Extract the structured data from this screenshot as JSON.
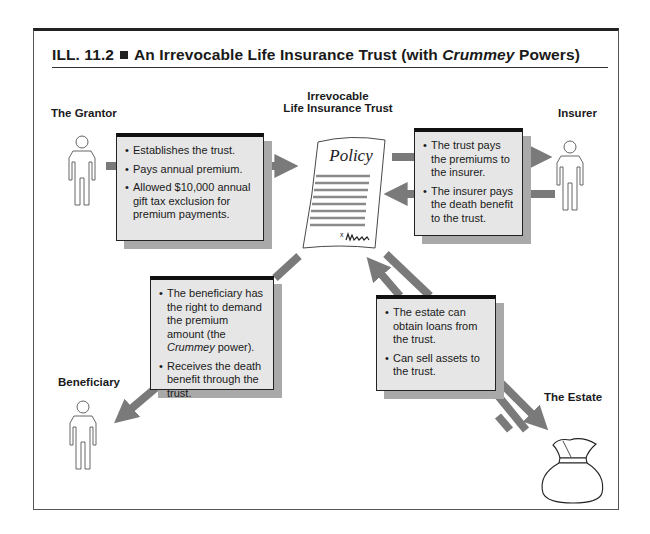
{
  "title": {
    "prefix": "ILL. 11.2",
    "text_before": "An Irrevocable Life Insurance Trust (with ",
    "italic": "Crummey",
    "text_after": " Powers)"
  },
  "nodes": {
    "grantor": {
      "label": "The Grantor",
      "icon": "person-icon"
    },
    "trust": {
      "label_line1": "Irrevocable",
      "label_line2": "Life Insurance Trust",
      "icon": "policy-document-icon",
      "policy_heading": "Policy",
      "signature_mark": "x"
    },
    "insurer": {
      "label": "Insurer",
      "icon": "person-icon"
    },
    "beneficiary": {
      "label": "Beneficiary",
      "icon": "person-icon"
    },
    "estate": {
      "label": "The Estate",
      "icon": "money-bag-icon"
    }
  },
  "boxes": {
    "grantor": {
      "bullets": [
        "Establishes the trust.",
        "Pays annual premium.",
        "Allowed $10,000 annual gift tax exclusion for premium payments."
      ]
    },
    "insurer": {
      "bullets": [
        "The trust pays the premiums to the insurer.",
        "The insurer pays the death benefit to the trust."
      ]
    },
    "beneficiary": {
      "bullet1": "The beneficiary has the right to demand the premium amount",
      "bullet1_pre": "(the ",
      "bullet1_italic": "Crummey",
      "bullet1_post": " power).",
      "bullet2": "Receives the death benefit through the trust."
    },
    "estate": {
      "bullets": [
        "The estate can obtain loans from the trust.",
        "Can sell assets to the trust."
      ]
    }
  },
  "colors": {
    "arrow": "#7a7a7a",
    "box_fill": "#e6e6e6",
    "box_shadow": "#a9a9a9",
    "border": "#222222"
  }
}
